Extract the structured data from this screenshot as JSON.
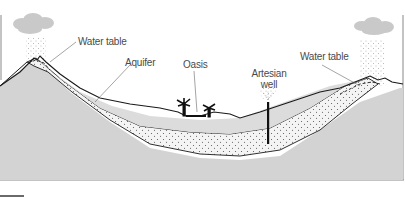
{
  "diagram": {
    "labels": {
      "water_table_left": "Water table",
      "aquifer": "Aquifer",
      "oasis": "Oasis",
      "artesian_well_line1": "Artesian",
      "artesian_well_line2": "well",
      "water_table_right": "Water table"
    },
    "colors": {
      "bedrock": "#d3d3d3",
      "aquifer": "#f3f3f3",
      "upper_layer": "#dcdcdc",
      "outline": "#1a1a1a",
      "cloud": "#c8c8c8",
      "label_text": "#4a4a4a"
    }
  }
}
